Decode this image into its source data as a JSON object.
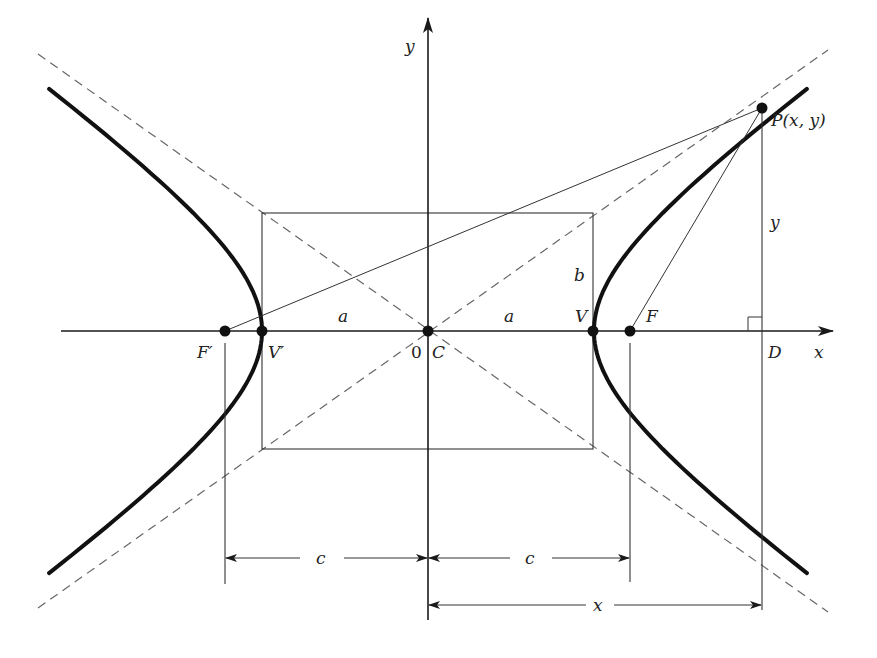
{
  "diagram": {
    "type": "hyperbola",
    "colors": {
      "ink": "#1a1a1a",
      "dashed": "#555555",
      "background": "#ffffff"
    },
    "axes": {
      "x_label": "x",
      "y_label": "y",
      "origin_label": "0"
    },
    "points": {
      "center": "C",
      "vertex_right": "V",
      "vertex_left": "V′",
      "focus_right": "F",
      "focus_left": "F′",
      "point_on_curve": "P(x, y)",
      "foot": "D"
    },
    "segment_labels": {
      "semi_major_left": "a",
      "semi_major_right": "a",
      "semi_minor": "b",
      "vertical_y": "y",
      "dim_c_left": "c",
      "dim_c_right": "c",
      "dim_x": "x"
    }
  }
}
